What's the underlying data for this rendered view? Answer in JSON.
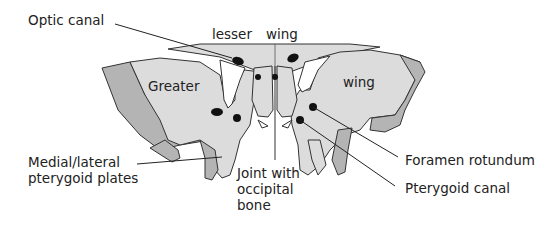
{
  "diagram": {
    "colors": {
      "light_bone": "#dcdcdc",
      "dark_bone": "#b4b4b4",
      "outline": "#333333",
      "foramen": "#111111",
      "background": "#ffffff"
    },
    "region_labels": {
      "lesser": "lesser",
      "wing_top": "wing",
      "greater": "Greater",
      "wing_right": "wing"
    },
    "callouts": {
      "optic_canal": "Optic canal",
      "pterygoid_plates_line1": "Medial/lateral",
      "pterygoid_plates_line2": "pterygoid plates",
      "joint_line1": "Joint with",
      "joint_line2": "occipital",
      "joint_line3": "bone",
      "foramen_rotundum": "Foramen rotundum",
      "pterygoid_canal": "Pterygoid canal"
    }
  }
}
